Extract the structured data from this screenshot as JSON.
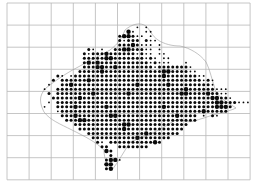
{
  "map": {
    "type": "distribution-dot-map",
    "background": "#ffffff",
    "grid": {
      "color": "#b8b8b8",
      "x0": 7,
      "y0": 3,
      "cell": 22.1,
      "cols": 11,
      "rows": 8
    },
    "dots": {
      "color": "#0a0a0a",
      "spacing": 4.42,
      "sizes": {
        "s": 0.9,
        "m": 1.5,
        "L": 2.2
      },
      "rows": [
        ".......................................................",
        ".......................................................",
        ".......................................................",
        ".......................................................",
        ".......................................................",
        ".............................s.s.......................",
        "...........................Ls..ss......................",
        ".........................mLLmss.s......................",
        ".........................msmmm.mss.....................",
        ".........................mmmLmsss.s....................",
        "..................ms.s..mmLLmmmss.s....................",
        ".................msmmmLmmmmmmsmss.ss...................",
        ".................mmmmmLLmmmmmmmsms.ss..................",
        ".................mLmLmmmmmmmmmmmsmsss...s..............",
        ".................mmmLLmmLmmmmmmmmsmmmmmmms.............",
        "................mmmmmLmmmmmmmmmmmmmLLmmmmss............",
        "...........ms.smmmmmmmmmmmmmmmmmmmmLmmmmmmmss..........",
        "..........m.mmmmmmLmmmmmmmmmmmmmmmmmmmmmmmmmsms........",
        ".........s..mmLmmmmmmmmmmmmmmLmmmmmmLmmmmmmmmms........",
        "........s..mmmmmmmmmmmmmmmmmmmmmmmmmmmmmLmmmmmmsss.....",
        ".........m.mmmmmmmmLmmmmmmmLmmmmmmmmmmmLLmmmmLmmss.....",
        "..........mmmmmmLmmmmmmmmmmmmmmmmmmmmmmmmmmmmmLLmms....",
        ".........s.mmmmmmmmmmmmmmmmmmmmmmmmmmmmmmmmmmmmLLmmmsss",
        "........s..mmmmLmmmmmmLmmmmmmmmmmmmLmmmmmmmmmmmLLLm....",
        "...........smmmmmmmmmmmmmmmmmmmmmmmmmmmmmmmmLmmmmm.....",
        "............mmmLmmmmmmmLLmmmmmmmmmmmmmLmmmm.s.ms.......",
        ".............mmmLLmmmmmmmmmmmmmmmmmmmmmmmmm............",
        "...............mmmmmmmmmmmLLmmmmmmmmmmmmm..............",
        "................mmmmmmmmmmLmmmmmmmmmmmmm...............",
        "..................mmmmmmmmmmmmmLmmmmmmm................",
        "...................mmmmmmmmmmLmmmmmmm..................",
        "....................ms.mmmmmmmmmmLm....................",
        ".....................mm..mmmmmmm.......................",
        "......................Lm...............................",
        ".......................m...............................",
        "......................mLLs.............................",
        "......................LL...............................",
        "......................mL...............................",
        ".......................................................",
        "......................................................."
      ]
    }
  }
}
